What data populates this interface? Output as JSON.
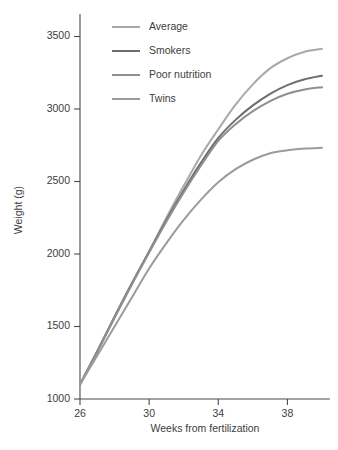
{
  "chart_data": {
    "type": "line",
    "title": "",
    "subtitle": "",
    "xlabel": "Weeks from fertilization",
    "ylabel": "Weight (g)",
    "xlim": [
      26,
      40
    ],
    "ylim": [
      1000,
      3600
    ],
    "grid": false,
    "legend_position": "top-left inside plot",
    "x_ticks": [
      26,
      30,
      34,
      38
    ],
    "x_tick_labels": [
      "26",
      "30",
      "34",
      "38"
    ],
    "y_ticks": [
      1000,
      1500,
      2000,
      2500,
      3000,
      3500
    ],
    "y_tick_labels": [
      "1000",
      "1500",
      "2000",
      "2500",
      "3000",
      "3500"
    ],
    "x": [
      26,
      27,
      28,
      29,
      30,
      31,
      32,
      33,
      34,
      35,
      36,
      37,
      38,
      39,
      40
    ],
    "series": [
      {
        "name": "Average",
        "color": "#a9a9a9",
        "values": [
          1100,
          1330,
          1570,
          1800,
          2020,
          2250,
          2470,
          2680,
          2860,
          3030,
          3170,
          3280,
          3350,
          3395,
          3415
        ]
      },
      {
        "name": "Smokers",
        "color": "#6e6e6e",
        "values": [
          1100,
          1330,
          1565,
          1795,
          2015,
          2235,
          2440,
          2630,
          2800,
          2925,
          3025,
          3105,
          3165,
          3205,
          3230
        ]
      },
      {
        "name": "Poor nutrition",
        "color": "#8f8f8f",
        "values": [
          1100,
          1325,
          1560,
          1790,
          2010,
          2225,
          2425,
          2610,
          2780,
          2895,
          2985,
          3055,
          3105,
          3135,
          3150
        ]
      },
      {
        "name": "Twins",
        "color": "#9b9b9b",
        "values": [
          1100,
          1300,
          1500,
          1700,
          1900,
          2075,
          2235,
          2375,
          2495,
          2585,
          2650,
          2695,
          2715,
          2727,
          2732
        ]
      }
    ]
  },
  "legend": {
    "items": [
      {
        "label": "Average",
        "color": "#a9a9a9"
      },
      {
        "label": "Smokers",
        "color": "#6e6e6e"
      },
      {
        "label": "Poor nutrition",
        "color": "#8f8f8f"
      },
      {
        "label": "Twins",
        "color": "#9b9b9b"
      }
    ]
  },
  "axes": {
    "x_title": "Weeks from fertilization",
    "y_title": "Weight (g)"
  }
}
